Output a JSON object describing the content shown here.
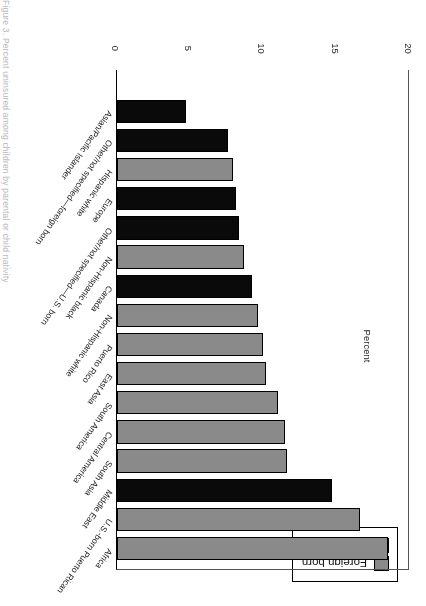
{
  "page": {
    "edge_caption": "Figure 3. Percent uninsured among children by parental or child nativity"
  },
  "legend": {
    "position": "top-left",
    "items": [
      {
        "label": "Foreign born",
        "color": "#8a8a8a",
        "key": "foreign"
      },
      {
        "label": "Native born",
        "color": "#0a0a0a",
        "key": "native"
      }
    ]
  },
  "axis": {
    "title": "Percent",
    "ticks": [
      "0",
      "5",
      "10",
      "15",
      "20"
    ]
  },
  "chart_data": {
    "type": "bar",
    "orientation": "horizontal",
    "title": "",
    "subtitle": "",
    "xlabel": "Percent",
    "ylabel": "",
    "xlim": [
      0,
      20
    ],
    "grid": false,
    "legend_position": "top-left",
    "tick_labels": [
      "0",
      "5",
      "10",
      "15",
      "20"
    ],
    "categories": [
      "Africa",
      "U.S.-born Puerto Rican",
      "Middle East",
      "South Asia",
      "Central America",
      "South America",
      "East Asia",
      "Puerto Rico",
      "Non-Hispanic white",
      "Canada",
      "Non-Hispanic black",
      "Other/not specified—U.S. born",
      "Europe",
      "Hispanic white",
      "Other/not specified—foreign born",
      "Asian/Pacific Islander"
    ],
    "values": [
      18.5,
      16.6,
      14.7,
      11.6,
      11.5,
      11.0,
      10.2,
      10.0,
      9.6,
      9.2,
      8.7,
      8.3,
      8.1,
      7.9,
      7.6,
      4.7
    ],
    "groups": [
      "foreign",
      "foreign",
      "native",
      "foreign",
      "foreign",
      "foreign",
      "foreign",
      "foreign",
      "foreign",
      "native",
      "foreign",
      "native",
      "native",
      "foreign",
      "native",
      "native"
    ],
    "series": [
      {
        "name": "Foreign born",
        "color": "#8a8a8a",
        "points": [
          {
            "category": "Africa",
            "value": 18.5
          },
          {
            "category": "U.S.-born Puerto Rican",
            "value": 16.6
          },
          {
            "category": "South Asia",
            "value": 11.6
          },
          {
            "category": "Central America",
            "value": 11.5
          },
          {
            "category": "South America",
            "value": 11.0
          },
          {
            "category": "East Asia",
            "value": 10.2
          },
          {
            "category": "Puerto Rico",
            "value": 10.0
          },
          {
            "category": "Non-Hispanic white",
            "value": 9.6
          },
          {
            "category": "Non-Hispanic black",
            "value": 8.7
          },
          {
            "category": "Hispanic white",
            "value": 7.9
          }
        ]
      },
      {
        "name": "Native born",
        "color": "#0a0a0a",
        "points": [
          {
            "category": "Middle East",
            "value": 14.7
          },
          {
            "category": "Canada",
            "value": 9.2
          },
          {
            "category": "Other/not specified—U.S. born",
            "value": 8.3
          },
          {
            "category": "Europe",
            "value": 8.1
          },
          {
            "category": "Other/not specified—foreign born",
            "value": 7.6
          },
          {
            "category": "Asian/Pacific Islander",
            "value": 4.7
          }
        ]
      }
    ]
  }
}
